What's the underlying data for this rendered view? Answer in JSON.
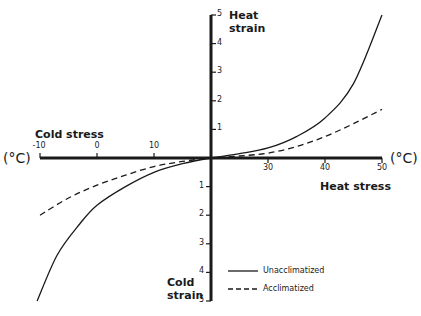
{
  "chart_data": {
    "type": "line",
    "title": "",
    "xlabel_right": "Heat stress",
    "xlabel_left": "Cold stress",
    "ylabel_top": "Heat strain",
    "ylabel_bottom": "Cold strain",
    "x_unit": "(°C)",
    "x_ticks": [
      -10,
      0,
      10,
      30,
      40,
      50
    ],
    "x_origin": 20,
    "xlim": [
      -10,
      50
    ],
    "y_ticks_top": [
      1,
      2,
      3,
      4,
      5
    ],
    "y_ticks_bottom": [
      1,
      2,
      3,
      4,
      5
    ],
    "ylim": [
      -5,
      5
    ],
    "grid": false,
    "legend_position": "lower right",
    "series": [
      {
        "name": "Unacclimatized",
        "style": "solid",
        "x": [
          -10.5,
          -7,
          -3,
          0,
          5,
          10,
          15,
          20,
          25,
          30,
          35,
          40,
          45,
          50
        ],
        "y": [
          -5.0,
          -3.4,
          -2.3,
          -1.65,
          -1.0,
          -0.5,
          -0.2,
          0.0,
          0.15,
          0.35,
          0.75,
          1.4,
          2.6,
          5.0
        ]
      },
      {
        "name": "Acclimatized",
        "style": "dashed",
        "x": [
          -10,
          -5,
          0,
          5,
          10,
          15,
          20,
          25,
          30,
          35,
          40,
          45,
          50
        ],
        "y": [
          -2.0,
          -1.4,
          -0.95,
          -0.6,
          -0.3,
          -0.12,
          0.0,
          0.07,
          0.17,
          0.4,
          0.75,
          1.2,
          1.7
        ]
      }
    ]
  },
  "labels": {
    "heat_strain_line1": "Heat",
    "heat_strain_line2": "strain",
    "cold_strain_line1": "Cold",
    "cold_strain_line2": "strain",
    "cold_stress": "Cold stress",
    "heat_stress": "Heat stress",
    "unit_left": "(°C)",
    "unit_right": "(°C)",
    "legend_solid": "Unacclimatized",
    "legend_dashed": "Acclimatized"
  }
}
